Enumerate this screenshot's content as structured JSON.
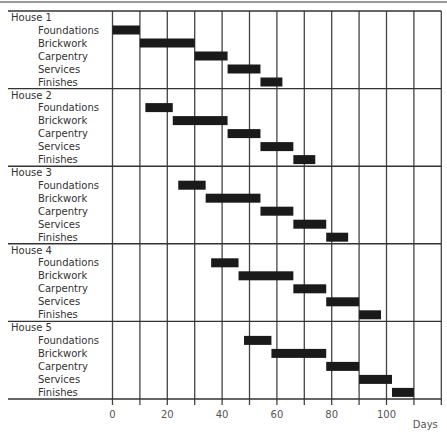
{
  "chart_data": {
    "type": "gantt",
    "title": "",
    "xlabel": "Days",
    "ylabel": "",
    "xlim": [
      0,
      120
    ],
    "x_ticks": [
      0,
      20,
      40,
      60,
      80,
      100
    ],
    "grid_interval": 10,
    "grid": true,
    "legend": null,
    "bar_color": "#1a1a1a",
    "groups": [
      {
        "name": "House 1",
        "tasks": [
          {
            "name": "Foundations",
            "start": 0,
            "end": 10
          },
          {
            "name": "Brickwork",
            "start": 10,
            "end": 30
          },
          {
            "name": "Carpentry",
            "start": 30,
            "end": 42
          },
          {
            "name": "Services",
            "start": 42,
            "end": 54
          },
          {
            "name": "Finishes",
            "start": 54,
            "end": 62
          }
        ]
      },
      {
        "name": "House 2",
        "tasks": [
          {
            "name": "Foundations",
            "start": 12,
            "end": 22
          },
          {
            "name": "Brickwork",
            "start": 22,
            "end": 42
          },
          {
            "name": "Carpentry",
            "start": 42,
            "end": 54
          },
          {
            "name": "Services",
            "start": 54,
            "end": 66
          },
          {
            "name": "Finishes",
            "start": 66,
            "end": 74
          }
        ]
      },
      {
        "name": "House 3",
        "tasks": [
          {
            "name": "Foundations",
            "start": 24,
            "end": 34
          },
          {
            "name": "Brickwork",
            "start": 34,
            "end": 54
          },
          {
            "name": "Carpentry",
            "start": 54,
            "end": 66
          },
          {
            "name": "Services",
            "start": 66,
            "end": 78
          },
          {
            "name": "Finishes",
            "start": 78,
            "end": 86
          }
        ]
      },
      {
        "name": "House 4",
        "tasks": [
          {
            "name": "Foundations",
            "start": 36,
            "end": 46
          },
          {
            "name": "Brickwork",
            "start": 46,
            "end": 66
          },
          {
            "name": "Carpentry",
            "start": 66,
            "end": 78
          },
          {
            "name": "Services",
            "start": 78,
            "end": 90
          },
          {
            "name": "Finishes",
            "start": 90,
            "end": 98
          }
        ]
      },
      {
        "name": "House 5",
        "tasks": [
          {
            "name": "Foundations",
            "start": 48,
            "end": 58
          },
          {
            "name": "Brickwork",
            "start": 58,
            "end": 78
          },
          {
            "name": "Carpentry",
            "start": 78,
            "end": 90
          },
          {
            "name": "Services",
            "start": 90,
            "end": 102
          },
          {
            "name": "Finishes",
            "start": 102,
            "end": 110
          }
        ]
      }
    ]
  }
}
